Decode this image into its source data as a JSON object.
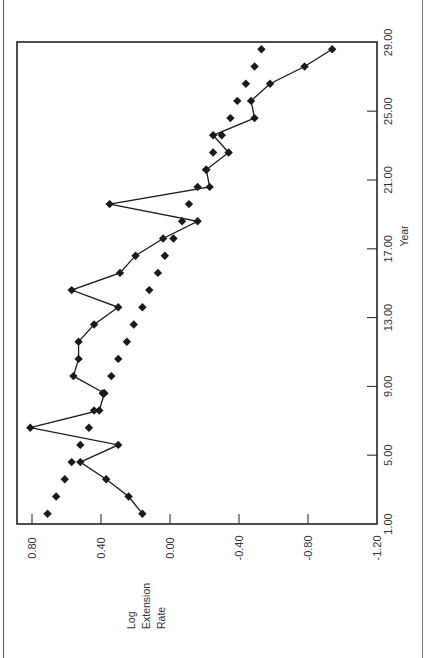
{
  "chart_data": {
    "type": "line",
    "orientation": "rotated-90-ccw",
    "title": "",
    "xlabel": "Year",
    "ylabel": "Log Extension Rate",
    "ylabel_lines": [
      "Log",
      "Extension",
      "Rate"
    ],
    "x_ticks": [
      "1.00",
      "5.00",
      "9.00",
      "13.00",
      "17.00",
      "21.00",
      "25.00",
      "29.00"
    ],
    "x_tick_values": [
      1,
      5,
      9,
      13,
      17,
      21,
      25,
      29
    ],
    "y_ticks": [
      "0.80",
      "0.40",
      "0.00",
      "-0.40",
      "-0.80",
      "-1.20"
    ],
    "y_tick_values": [
      0.8,
      0.4,
      0.0,
      -0.4,
      -0.8,
      -1.2
    ],
    "xlim": [
      1,
      29
    ],
    "ylim": [
      -1.2,
      0.88
    ],
    "grid": false,
    "legend": null,
    "x": [
      1.6,
      2.6,
      3.6,
      4.6,
      5.6,
      6.6,
      7.6,
      8.6,
      9.6,
      10.6,
      11.6,
      12.6,
      13.6,
      14.6,
      15.6,
      16.6,
      17.6,
      18.6,
      19.6,
      20.6,
      21.6,
      22.6,
      23.6,
      24.6,
      25.6,
      26.6,
      27.6,
      28.6
    ],
    "series": [
      {
        "name": "Observed (connected)",
        "style": "line-markers",
        "values": [
          0.16,
          0.24,
          0.37,
          0.52,
          0.3,
          0.81,
          0.41,
          0.38,
          0.56,
          0.53,
          0.53,
          0.44,
          0.3,
          0.57,
          0.29,
          0.2,
          0.04,
          -0.16,
          0.35,
          -0.23,
          -0.21,
          -0.34,
          -0.25,
          -0.49,
          -0.47,
          -0.58,
          -0.78,
          -0.94
        ]
      },
      {
        "name": "Fitted trend (markers only)",
        "style": "markers",
        "values": [
          0.71,
          0.66,
          0.61,
          0.57,
          0.52,
          0.47,
          0.44,
          0.39,
          0.34,
          0.3,
          0.25,
          0.21,
          0.16,
          0.12,
          0.07,
          0.03,
          -0.02,
          -0.07,
          -0.11,
          -0.16,
          -0.21,
          -0.25,
          -0.3,
          -0.35,
          -0.39,
          -0.44,
          -0.49,
          -0.53
        ]
      }
    ]
  },
  "colors": {
    "ink": "#1a1a1a",
    "axis": "#222222",
    "label": "#333333",
    "background": "#ffffff"
  }
}
